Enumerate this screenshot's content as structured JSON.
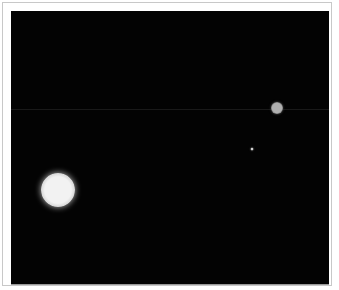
{
  "image": {
    "kind": "astronomical-photograph",
    "background_color": "#030303",
    "frame_border_color": "#c8c8c8",
    "scanline_y": 98
  },
  "objects": [
    {
      "name": "large-bright-body",
      "cx": 47,
      "cy": 179,
      "radius": 17,
      "core_color": "#f2f2f2",
      "edge_color": "#bdbdbd"
    },
    {
      "name": "small-dim-body",
      "cx": 266,
      "cy": 97,
      "radius": 6,
      "core_color": "#b0b0b0",
      "edge_color": "#555555"
    },
    {
      "name": "tiny-point",
      "cx": 241,
      "cy": 138,
      "radius": 1.5,
      "core_color": "#d0d0d0",
      "edge_color": "#606060"
    }
  ]
}
